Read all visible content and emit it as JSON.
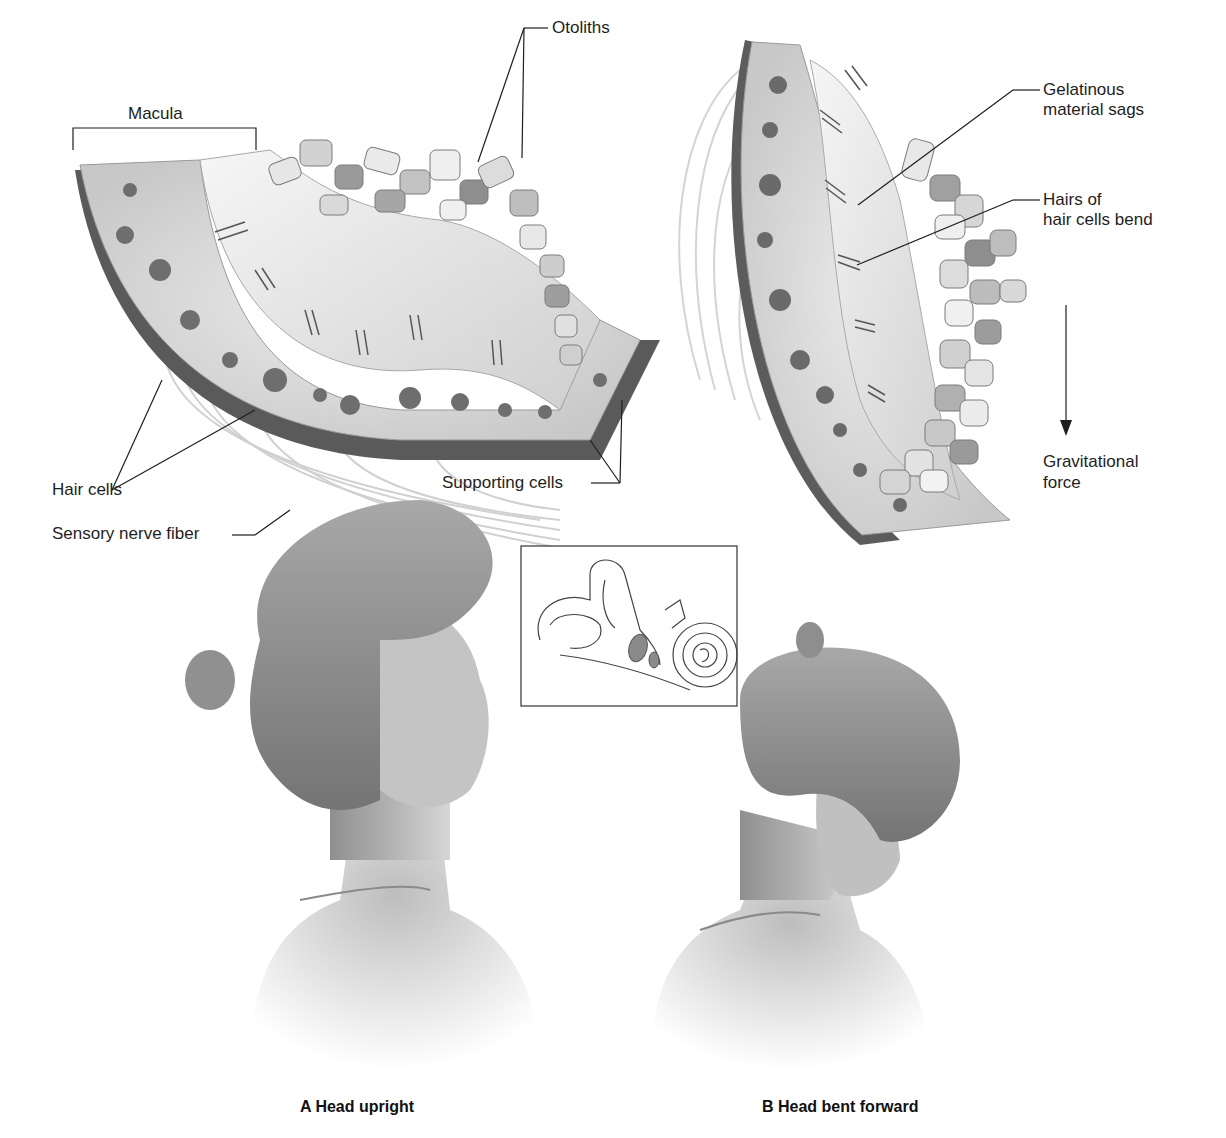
{
  "figure": {
    "panel_top_left": {
      "labels": {
        "macula": "Macula",
        "otoliths": "Otoliths",
        "hair_cells": "Hair cells",
        "supporting_cells": "Supporting cells",
        "sensory_nerve_fiber": "Sensory nerve fiber"
      }
    },
    "panel_top_right": {
      "labels": {
        "gelatinous_line1": "Gelatinous",
        "gelatinous_line2": "material sags",
        "hairs_line1": "Hairs of",
        "hairs_line2": "hair cells bend",
        "gravity_line1": "Gravitational",
        "gravity_line2": "force"
      }
    },
    "inset": {
      "subject": "inner-ear-labyrinth"
    },
    "captions": {
      "a": "A Head upright",
      "b": "B Head bent forward"
    },
    "colors": {
      "ink": "#1e1e1e",
      "cell_fill": "#d8d8d8",
      "nucleus": "#6e6e6e",
      "otolith_light": "#e6e6e6",
      "otolith_dark": "#8a8a8a",
      "skin": "#c4c4c4",
      "hair": "#8c8c8c"
    }
  }
}
